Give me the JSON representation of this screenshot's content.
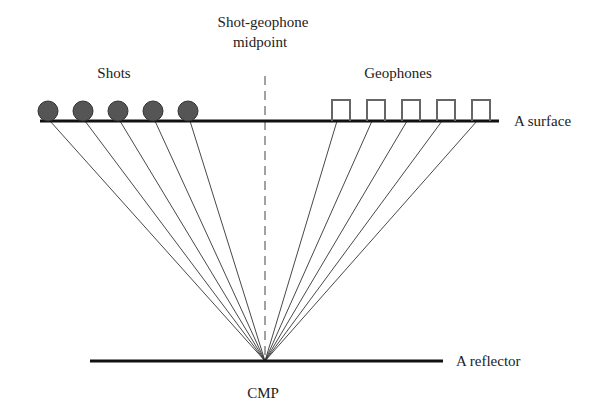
{
  "labels": {
    "midpoint_line1": "Shot-geophone",
    "midpoint_line2": "midpoint",
    "shots": "Shots",
    "geophones": "Geophones",
    "surface": "A surface",
    "reflector": "A reflector",
    "cmp": "CMP"
  },
  "colors": {
    "line": "#111111",
    "ray": "#333333",
    "shot_fill": "#555555",
    "geophone_stroke": "#666666"
  },
  "shots_x": [
    48,
    83,
    118,
    153,
    188
  ],
  "geophones_x": [
    332,
    367,
    402,
    437,
    472
  ],
  "cmp": {
    "x": 265,
    "y": 361
  }
}
